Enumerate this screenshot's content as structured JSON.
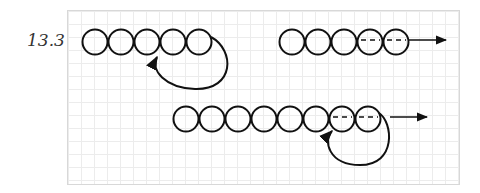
{
  "figure_label": "13.3",
  "diagrams": [
    {
      "name": "cycle-at-end",
      "nodes": 5,
      "dashed_nodes": [],
      "loop_from": 5,
      "loop_to": 4,
      "exit_arrow": false
    },
    {
      "name": "path-to-infinity",
      "nodes": 5,
      "dashed_nodes": [
        4,
        5
      ],
      "exit_arrow": true
    },
    {
      "name": "cycle-and-path",
      "nodes": 8,
      "dashed_nodes": [
        7,
        8
      ],
      "loop_from": 8,
      "loop_to": 7,
      "exit_arrow": true
    }
  ],
  "colors": {
    "stroke": "#111111",
    "grid": "#ececec",
    "border": "#d8d8d8"
  }
}
